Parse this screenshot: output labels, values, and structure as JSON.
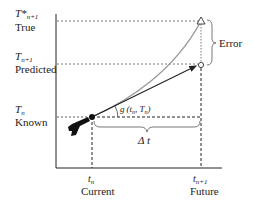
{
  "diagram": {
    "y_labels": [
      {
        "symbol": "T*",
        "subscript": "n+1",
        "caption": "True"
      },
      {
        "symbol": "T",
        "subscript": "n+1",
        "caption": "Predicted"
      },
      {
        "symbol": "T",
        "subscript": "n",
        "caption": "Known"
      }
    ],
    "x_labels": [
      {
        "symbol": "t",
        "subscript": "n",
        "caption": "Current"
      },
      {
        "symbol": "t",
        "subscript": "n+1",
        "caption": "Future"
      }
    ],
    "slope_label": "g (t_n, T_n)",
    "slope_label_g": "g",
    "slope_label_args": "(t",
    "slope_label_n1": "n",
    "slope_label_mid": ", T",
    "slope_label_n2": "n",
    "slope_label_end": ")",
    "interval_label": "Δ t",
    "error_label": "Error",
    "colors": {
      "true_curve": "#9a9a9a",
      "prediction_arrow": "#222222",
      "axes": "#222222"
    }
  }
}
